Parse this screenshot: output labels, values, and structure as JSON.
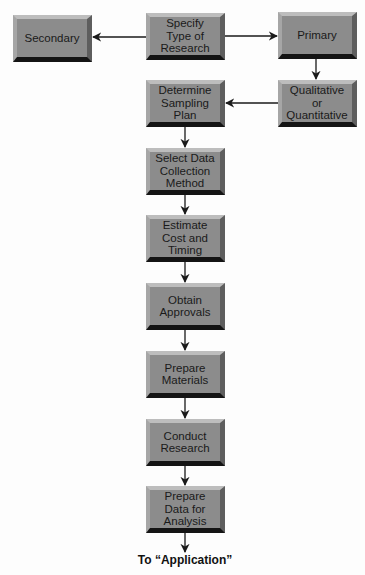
{
  "diagram": {
    "type": "flowchart",
    "colors": {
      "box_face": "#8c8c8c",
      "box_bevel_top": "#bdbdbd",
      "box_bevel_bottom": "#141414",
      "arrow": "#1a1a1a",
      "background": "#ffffff"
    },
    "nodes": {
      "specify": {
        "label": "Specify\nType of\nResearch"
      },
      "secondary": {
        "label": "Secondary"
      },
      "primary": {
        "label": "Primary"
      },
      "qualquant": {
        "label": "Qualitative\nor\nQuantitative"
      },
      "sampling": {
        "label": "Determine\nSampling\nPlan"
      },
      "collection": {
        "label": "Select Data\nCollection\nMethod"
      },
      "cost": {
        "label": "Estimate\nCost and\nTiming"
      },
      "approvals": {
        "label": "Obtain\nApprovals"
      },
      "materials": {
        "label": "Prepare\nMaterials"
      },
      "conduct": {
        "label": "Conduct\nResearch"
      },
      "prepdata": {
        "label": "Prepare\nData for\nAnalysis"
      }
    },
    "edges": [
      {
        "from": "specify",
        "to": "secondary"
      },
      {
        "from": "specify",
        "to": "primary"
      },
      {
        "from": "primary",
        "to": "qualquant"
      },
      {
        "from": "qualquant",
        "to": "sampling"
      },
      {
        "from": "sampling",
        "to": "collection"
      },
      {
        "from": "collection",
        "to": "cost"
      },
      {
        "from": "cost",
        "to": "approvals"
      },
      {
        "from": "approvals",
        "to": "materials"
      },
      {
        "from": "materials",
        "to": "conduct"
      },
      {
        "from": "conduct",
        "to": "prepdata"
      },
      {
        "from": "prepdata",
        "to": "application"
      }
    ],
    "footer": {
      "label": "To “Application”"
    }
  }
}
